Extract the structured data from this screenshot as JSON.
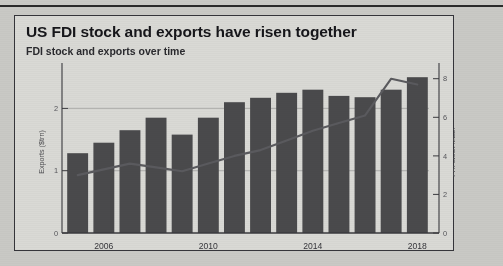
{
  "card": {
    "title": "US FDI stock and exports have risen together",
    "subtitle": "FDI stock and exports over time"
  },
  "chart_data": {
    "type": "bar",
    "title": "US FDI stock and exports have risen together",
    "subtitle": "FDI stock and exports over time",
    "xlabel": "",
    "ylabel": "Exports ($trn)",
    "y2label": "FDI stock ($trn)",
    "grid": true,
    "legend": "none",
    "xlim": [
      2004.4,
      2018.6
    ],
    "ylim": [
      0,
      2.6
    ],
    "y2lim": [
      0,
      8.4
    ],
    "yticks": [
      0,
      1,
      2
    ],
    "ytick_labels": [
      "0",
      "1",
      "2"
    ],
    "y2ticks": [
      0,
      2,
      4,
      6,
      8
    ],
    "y2tick_labels": [
      "0",
      "2",
      "4",
      "6",
      "8"
    ],
    "xticks": [
      2006,
      2010,
      2014,
      2018
    ],
    "xtick_labels": [
      "2006",
      "2010",
      "2014",
      "2018"
    ],
    "x": [
      2005,
      2006,
      2007,
      2008,
      2009,
      2010,
      2011,
      2012,
      2013,
      2014,
      2015,
      2016,
      2017,
      2018
    ],
    "series": [
      {
        "name": "Exports ($trn)",
        "type": "bar",
        "axis": "left",
        "color": "#4a4a4c",
        "values": [
          1.28,
          1.45,
          1.65,
          1.85,
          1.58,
          1.85,
          2.1,
          2.17,
          2.25,
          2.3,
          2.2,
          2.18,
          2.3,
          2.5
        ]
      },
      {
        "name": "FDI stock ($trn)",
        "type": "line",
        "axis": "right",
        "color": "#5a5a5e",
        "values": [
          3.0,
          3.3,
          3.6,
          3.4,
          3.2,
          3.6,
          4.0,
          4.3,
          4.8,
          5.3,
          5.7,
          6.1,
          8.0,
          7.7
        ]
      }
    ]
  },
  "colors": {
    "bar": "#4a4a4c",
    "line": "#5a5a5e",
    "card_bg": "#d9d9d5",
    "page_bg": "#c9c9c5",
    "axis": "#3a3a3e",
    "grid": "#a8a8a6"
  }
}
